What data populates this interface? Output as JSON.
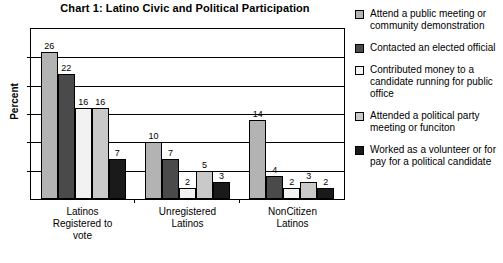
{
  "chart_data": {
    "type": "bar",
    "title": "Chart 1: Latino Civic and Political Participation",
    "xlabel": "",
    "ylabel": "Percent",
    "ylim": [
      0,
      30
    ],
    "grid": true,
    "legend_position": "right",
    "categories": [
      "Latinos Registered to vote",
      "Unregistered Latinos",
      "NonCitizen Latinos"
    ],
    "category_lines": [
      [
        "Latinos",
        "Registered to",
        "vote"
      ],
      [
        "Unregistered",
        "Latinos"
      ],
      [
        "NonCitizen",
        "Latinos"
      ]
    ],
    "series": [
      {
        "name": "Attend a public meeting or community demonstration",
        "color": "#b3b3b3",
        "values": [
          26,
          10,
          14
        ]
      },
      {
        "name": "Contacted an elected official",
        "color": "#4a4a4a",
        "values": [
          22,
          7,
          4
        ]
      },
      {
        "name": "Contributed money to a candidate running for public office",
        "color": "#f2f2f2",
        "values": [
          16,
          2,
          2
        ]
      },
      {
        "name": "Attended a political party meeting or funciton",
        "color": "#c9c9c9",
        "values": [
          16,
          5,
          3
        ]
      },
      {
        "name": "Worked as a volunteer or for pay for a political candidate",
        "color": "#1a1a1a",
        "values": [
          7,
          3,
          2
        ]
      }
    ],
    "gridline_count": 5
  },
  "legend": {
    "items": [
      {
        "label": "Attend a public meeting or community demonstration",
        "color": "#b3b3b3"
      },
      {
        "label": "Contacted an elected official",
        "color": "#4a4a4a"
      },
      {
        "label": "Contributed money to a candidate running for public office",
        "color": "#f2f2f2"
      },
      {
        "label": "Attended a political party meeting or funciton",
        "color": "#c9c9c9"
      },
      {
        "label": "Worked as a volunteer or for pay for a political candidate",
        "color": "#1a1a1a"
      }
    ]
  }
}
